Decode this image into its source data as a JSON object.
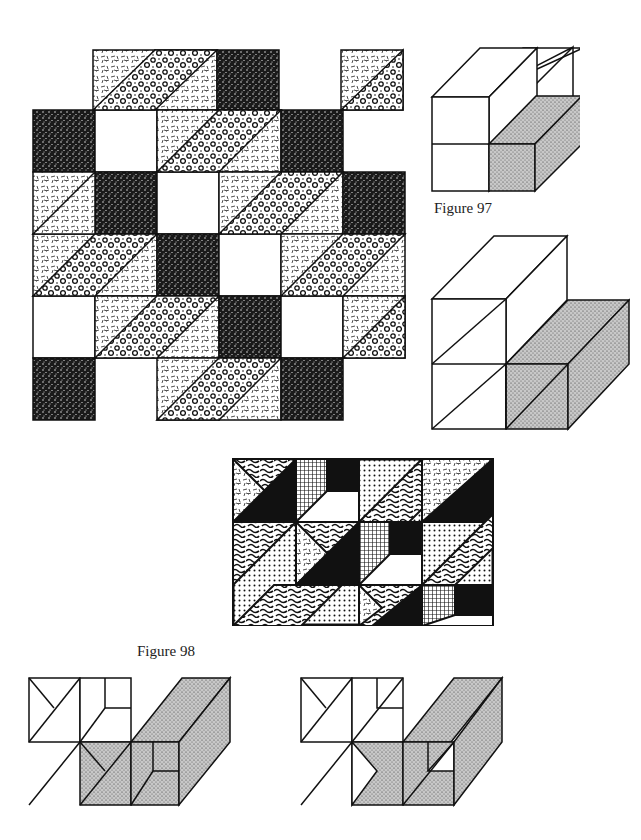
{
  "page": {
    "captions": {
      "figure97": "Figure 97",
      "figure98": "Figure 98"
    }
  },
  "figures": [
    {
      "id": "quilt-large",
      "description": "Patchwork quilt block of squares and diagonal stripes with textured fills"
    },
    {
      "id": "figure-97-top",
      "description": "Isometric block diagram, upper white box with shaded lower box"
    },
    {
      "id": "figure-97-bottom",
      "description": "Isometric block diagram with diagonal subdivisions"
    },
    {
      "id": "figure-98-quilt",
      "description": "Patchwork panel with triangles and dotted / wormy textures"
    },
    {
      "id": "diagram-bottom-left",
      "description": "Isometric cube outline with shaded faces"
    },
    {
      "id": "diagram-bottom-right",
      "description": "Isometric cube outline variant with shaded faces"
    }
  ],
  "colors": {
    "ink": "#111111",
    "paper": "#ffffff",
    "stipple": "#9a9a9a"
  }
}
